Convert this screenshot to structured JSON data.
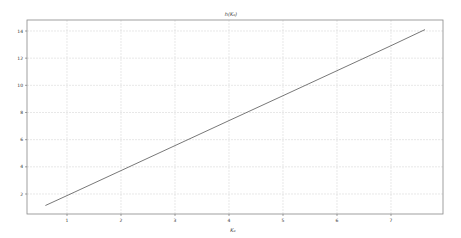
{
  "chart_data": {
    "type": "line",
    "title": "h(K₀)",
    "xlabel": "K₀",
    "ylabel": "",
    "xlim": [
      0.2,
      7.95
    ],
    "ylim": [
      0.2,
      15.0
    ],
    "xticks": [
      1,
      2,
      3,
      4,
      5,
      6,
      7
    ],
    "yticks": [
      2,
      4,
      6,
      8,
      10,
      12,
      14
    ],
    "grid": true,
    "legend": null,
    "series": [
      {
        "name": "h(K₀)",
        "color": "#555555",
        "x": [
          0.6,
          1.0,
          2.0,
          3.0,
          4.0,
          5.0,
          6.0,
          7.0,
          7.63
        ],
        "y": [
          1.15,
          1.88,
          3.72,
          5.56,
          7.4,
          9.24,
          11.08,
          12.92,
          14.1
        ]
      }
    ]
  }
}
